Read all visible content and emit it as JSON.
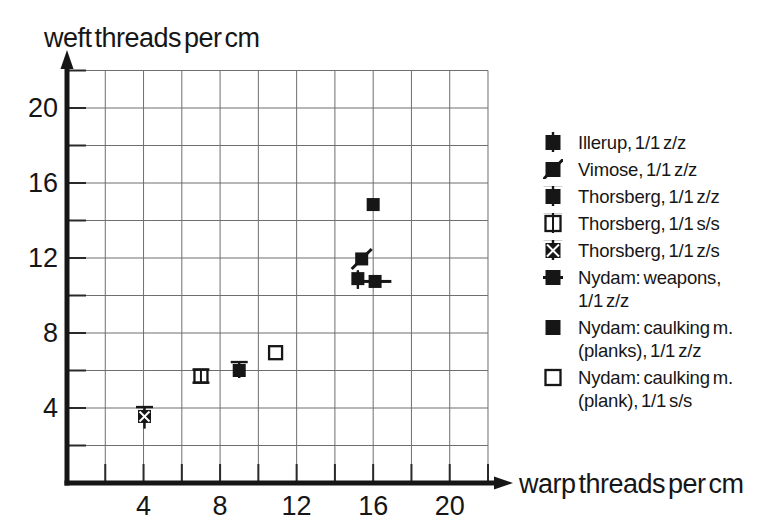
{
  "figure": {
    "background": "#ffffff",
    "ink": "#161616",
    "grid_color": "#6f6f6f",
    "tick_color": "#2a2a2a"
  },
  "titles": {
    "y_axis": "weft threads per cm",
    "x_axis": "warp threads per cm"
  },
  "chart_data": {
    "type": "scatter",
    "title": "",
    "xlabel": "warp threads per cm",
    "ylabel": "weft threads per cm",
    "xlim": [
      0,
      23
    ],
    "ylim": [
      0,
      23
    ],
    "grid": true,
    "grid_step": 2,
    "x_ticks_labeled": [
      4,
      8,
      12,
      16,
      20
    ],
    "y_ticks_labeled": [
      4,
      8,
      12,
      16,
      20
    ],
    "legend_position": "right",
    "series": [
      {
        "name": "Illerup, 1/1 z/z",
        "symbol": "square-vline",
        "points": [
          {
            "x": 15.2,
            "y": 10.9,
            "y_err": [
              10.35,
              11.35
            ]
          }
        ]
      },
      {
        "name": "Vimose, 1/1 z/z",
        "symbol": "square-slash",
        "points": [
          {
            "x": 15.4,
            "y": 11.95
          }
        ]
      },
      {
        "name": "Thorsberg, 1/1 z/z",
        "symbol": "square-tcap",
        "points": [
          {
            "x": 9.0,
            "y": 6.0,
            "y_err": [
              5.6,
              6.45
            ]
          }
        ]
      },
      {
        "name": "Thorsberg, 1/1 s/s",
        "symbol": "osquare-ibeam",
        "points": [
          {
            "x": 7.0,
            "y": 5.7,
            "y_err": [
              5.35,
              6.05
            ]
          }
        ]
      },
      {
        "name": "Thorsberg, 1/1 z/s",
        "symbol": "square-x-cap",
        "points": [
          {
            "x": 4.05,
            "y": 3.55,
            "y_err": [
              2.9,
              4.05
            ]
          }
        ]
      },
      {
        "name": "Nydam: weapons, 1/1 z/z",
        "symbol": "square-hline",
        "points": [
          {
            "x": 16.1,
            "y": 10.75,
            "x_err": [
              15.5,
              16.95
            ]
          }
        ]
      },
      {
        "name": "Nydam: caulking m. (planks), 1/1 z/z",
        "symbol": "square",
        "points": [
          {
            "x": 16.0,
            "y": 14.85
          }
        ]
      },
      {
        "name": "Nydam: caulking m. (plank), 1/1 s/s",
        "symbol": "osquare",
        "points": [
          {
            "x": 10.9,
            "y": 6.95
          }
        ]
      }
    ]
  },
  "legend": {
    "items": [
      {
        "symbol": "square-vline",
        "lines": [
          "Illerup, 1/1 z/z"
        ]
      },
      {
        "symbol": "square-slash",
        "lines": [
          "Vimose, 1/1 z/z"
        ]
      },
      {
        "symbol": "square-tcap",
        "lines": [
          "Thorsberg, 1/1 z/z"
        ]
      },
      {
        "symbol": "osquare-ibeam",
        "lines": [
          "Thorsberg, 1/1 s/s"
        ]
      },
      {
        "symbol": "square-x-cap",
        "lines": [
          "Thorsberg, 1/1 z/s"
        ]
      },
      {
        "symbol": "square-hline",
        "lines": [
          "Nydam: weapons,",
          "1/1 z/z"
        ]
      },
      {
        "symbol": "square",
        "lines": [
          "Nydam: caulking m.",
          "(planks), 1/1 z/z"
        ]
      },
      {
        "symbol": "osquare",
        "lines": [
          "Nydam: caulking m.",
          "(plank), 1/1 s/s"
        ]
      }
    ]
  }
}
